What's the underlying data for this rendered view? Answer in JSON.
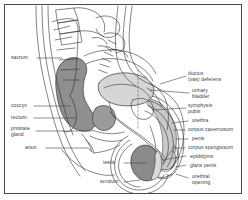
{
  "figure": {
    "frame_color": "#4a4a4a",
    "background": "#ffffff",
    "line_color": "#333333"
  },
  "shading": {
    "rectum_fill": "#8f8f8f",
    "bladder_fill": "#d6d6d6",
    "prostate_fill": "#9a9a9a",
    "testis_fill": "#8a8a8a",
    "corpus_fill": "#c9c9c9",
    "light_tissue": "#eaeaea"
  },
  "labels": {
    "left": [
      {
        "id": "sacrum",
        "text": "sacrum"
      },
      {
        "id": "coccyx",
        "text": "coccyx"
      },
      {
        "id": "rectum",
        "text": "rectum"
      },
      {
        "id": "prostate-gland",
        "text_line1": "prostate",
        "text_line2": "gland"
      },
      {
        "id": "anus",
        "text": "anus"
      }
    ],
    "right": [
      {
        "id": "ductus-vas-deferens",
        "text_line1": "ductus",
        "text_line2": "(vas) deferens"
      },
      {
        "id": "urinary-bladder",
        "text_line1": "urinary",
        "text_line2": "bladder"
      },
      {
        "id": "symphysis-pubis",
        "text_line1": "symphysis",
        "text_line2": "pubis"
      },
      {
        "id": "urethra",
        "text": "urethra"
      },
      {
        "id": "corpus-cavernosum",
        "text": "corpus cavernosum"
      },
      {
        "id": "penis",
        "text": "penis"
      },
      {
        "id": "corpus-spongiosum",
        "text": "corpus spongiosum"
      },
      {
        "id": "epididymis",
        "text": "epididyms"
      },
      {
        "id": "glans-penis",
        "text": "glans penis"
      },
      {
        "id": "urethral-opening",
        "text_line1": "urethral",
        "text_line2": "opening"
      }
    ],
    "bottom": [
      {
        "id": "testis",
        "text": "testis"
      },
      {
        "id": "scrotum",
        "text": "scrotum"
      }
    ]
  }
}
